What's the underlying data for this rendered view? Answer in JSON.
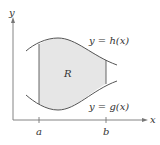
{
  "diagram": {
    "axes": {
      "x_label": "x",
      "y_label": "y"
    },
    "ticks": [
      {
        "label": "a"
      },
      {
        "label": "b"
      }
    ],
    "region_label": "R",
    "curves": {
      "upper": "y = h(x)",
      "lower": "y = g(x)"
    },
    "colors": {
      "region_fill": "#e6e6e6",
      "curve": "#555555",
      "axis": "#777777"
    }
  }
}
